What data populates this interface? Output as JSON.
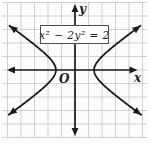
{
  "figure": {
    "equation": "x² − 2y² = 2",
    "x_axis_label": "x",
    "y_axis_label": "y",
    "origin_label": "O"
  },
  "colors": {
    "ink": "#1b1b1b",
    "grid": "#c5c5c5",
    "background": "#fcfcfc",
    "box_background": "#ffffff",
    "box_border": "#4d4d4d"
  },
  "chart_data": {
    "type": "line",
    "title": "",
    "equation_label": "x² − 2y² = 2",
    "curve_kind": "hyperbola",
    "orientation": "opens left and right",
    "implicit": {
      "x2": 1,
      "y2": -2,
      "rhs": 2
    },
    "vertices": [
      [
        -1.41,
        0
      ],
      [
        1.41,
        0
      ]
    ],
    "asymptotes": [
      "y = x/√2",
      "y = −x/√2"
    ],
    "xlabel": "x",
    "ylabel": "y",
    "origin_label": "O",
    "grid": true,
    "legend": false,
    "x_range": [
      -5.4,
      5.4
    ],
    "y_range": [
      -5,
      5
    ],
    "series": [
      {
        "name": "right-branch",
        "points": [
          [
            4.47,
            -3
          ],
          [
            3.16,
            -2
          ],
          [
            2.0,
            -1
          ],
          [
            1.41,
            0
          ],
          [
            2.0,
            1
          ],
          [
            3.16,
            2
          ],
          [
            4.47,
            3
          ]
        ]
      },
      {
        "name": "left-branch",
        "points": [
          [
            -4.47,
            -3
          ],
          [
            -3.16,
            -2
          ],
          [
            -2.0,
            -1
          ],
          [
            -1.41,
            0
          ],
          [
            -2.0,
            1
          ],
          [
            -3.16,
            2
          ],
          [
            -4.47,
            3
          ]
        ]
      }
    ],
    "layout": {
      "origin_px": [
        75,
        70
      ],
      "unit_px": 13.5,
      "grid_px": {
        "x0": 2,
        "y0": 2.5,
        "x1": 146.5,
        "y1": 137.5
      },
      "axis_ends": {
        "x": [
          7,
          137.5
        ],
        "y": [
          4,
          136
        ]
      },
      "y_extent_units": 3.32,
      "label_px": {
        "x": [
          134,
          82
        ],
        "y": [
          79,
          13
        ],
        "o": [
          59,
          83
        ]
      }
    }
  }
}
